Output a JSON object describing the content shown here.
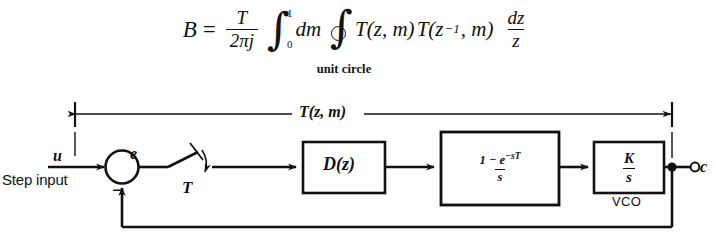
{
  "equation": {
    "lhs": "B",
    "equals": "=",
    "coefficient": {
      "numerator": "T",
      "denominator": "2πj"
    },
    "definite_integral": {
      "upper_limit": "1",
      "lower_limit": "0"
    },
    "measure": "dm",
    "contour_label": "unit circle",
    "integrand_first": "T(z, m)",
    "integrand_second_base": "T(z",
    "integrand_second_exponent": "−1",
    "integrand_second_tail": ", m)",
    "differential": {
      "numerator": "dz",
      "denominator": "z"
    },
    "plain_text": "B = T/(2πj) ∫₀¹ dm ∮ T(z, m)T(z⁻¹, m) dz/z"
  },
  "diagram": {
    "span_label": "T(z, m)",
    "input_label": "u",
    "input_caption": "Step input",
    "error_label": "e",
    "feedback_sign": "−",
    "sampler_label": "T",
    "controller_label": "D(z)",
    "zoh": {
      "numerator_prefix": "1 − e",
      "numerator_exponent": "−sT",
      "denominator": "s"
    },
    "vco": {
      "numerator": "K",
      "denominator": "s",
      "caption": "VCO"
    },
    "output_label": "c"
  },
  "colors": {
    "ink": "#111111",
    "background": "#ffffff"
  }
}
